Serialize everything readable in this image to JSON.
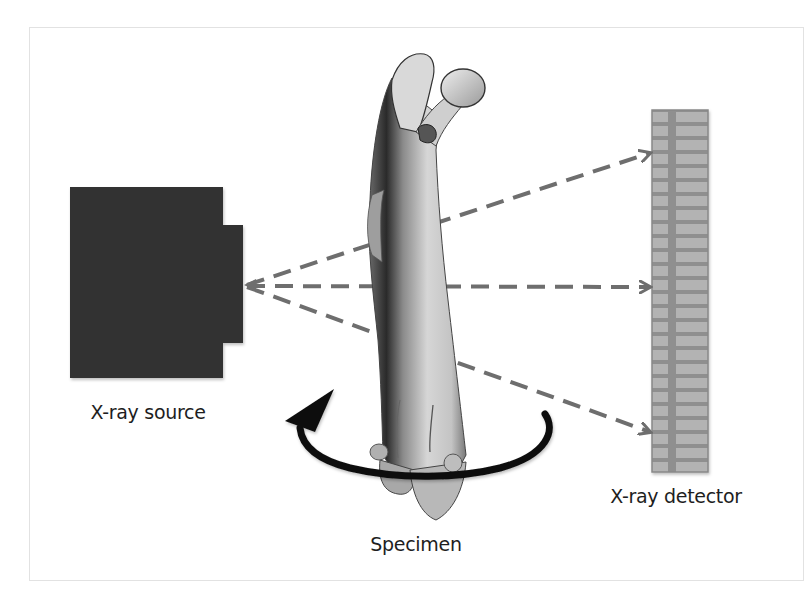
{
  "figure": {
    "labels": {
      "source": "X-ray source",
      "specimen": "Specimen",
      "detector": "X-ray detector"
    },
    "components": {
      "source": {
        "shape": "dark-box-with-nozzle",
        "color": "#333333"
      },
      "specimen": {
        "shape": "femur-bone",
        "color": "#bdbdbd"
      },
      "detector": {
        "shape": "segmented-panel",
        "color": "#9a9a9a",
        "segments": 26
      },
      "rotation": {
        "shape": "curved-arrow",
        "direction": "counter-clockwise",
        "color": "#111111"
      },
      "rays": {
        "count": 3,
        "style": "dashed",
        "color": "#707070"
      }
    }
  }
}
